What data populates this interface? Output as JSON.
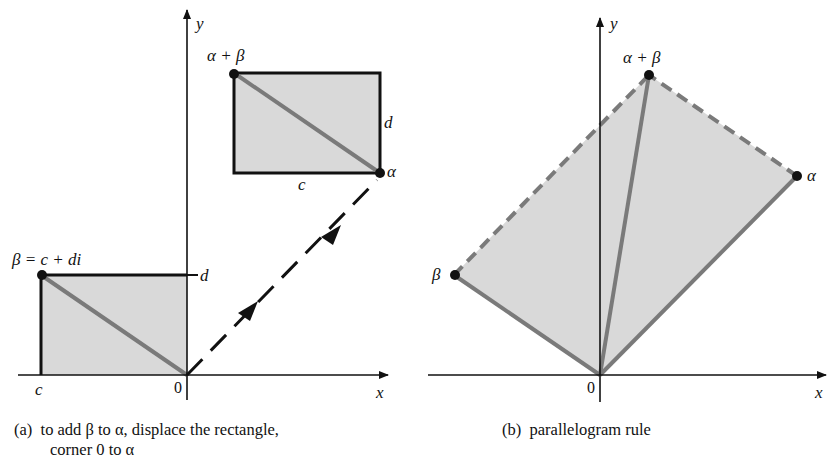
{
  "figure": {
    "panel_a": {
      "axis_x_label": "x",
      "axis_y_label": "y",
      "origin_label": "0",
      "point_beta_label": "β = c + di",
      "point_alpha_label": "α",
      "point_sum_label": "α + β",
      "tick_c_label": "c",
      "tick_d_label": "d",
      "rect_width_label": "c",
      "rect_height_label": "d",
      "caption_prefix": "(a)",
      "caption_line1": "to add β to α, displace the rectangle,",
      "caption_line2": "corner 0 to α"
    },
    "panel_b": {
      "axis_x_label": "x",
      "axis_y_label": "y",
      "origin_label": "0",
      "point_beta_label": "β",
      "point_alpha_label": "α",
      "point_sum_label": "α + β",
      "caption_prefix": "(b)",
      "caption_text": "parallelogram rule"
    },
    "colors": {
      "fill": "#d9d9d9",
      "diagonal": "#7a7a7a",
      "axis": "#111111"
    }
  }
}
